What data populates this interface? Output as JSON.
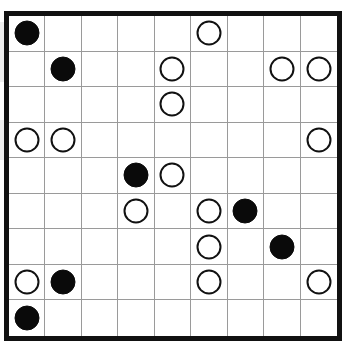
{
  "board": {
    "name": "go-style-stone-grid-puzzle",
    "columns": 9,
    "rows": 9,
    "border_color": "#111111",
    "gridline_color": "#9a9a9a",
    "background_color": "#ffffff",
    "black_stone_color": "#0a0a0a",
    "white_stone_color": "#ffffff",
    "white_stone_outline_color": "#111111",
    "empty_label": "",
    "black_label": "black-stone",
    "white_label": "white-stone",
    "cells": [
      [
        "B",
        "",
        "",
        "",
        "",
        "W",
        "",
        "",
        ""
      ],
      [
        "",
        "B",
        "",
        "",
        "W",
        "",
        "",
        "W",
        "W"
      ],
      [
        "",
        "",
        "",
        "",
        "W",
        "",
        "",
        "",
        ""
      ],
      [
        "W",
        "W",
        "",
        "",
        "",
        "",
        "",
        "",
        "W"
      ],
      [
        "",
        "",
        "",
        "B",
        "W",
        "",
        "",
        "",
        ""
      ],
      [
        "",
        "",
        "",
        "W",
        "",
        "W",
        "B",
        "",
        ""
      ],
      [
        "",
        "",
        "",
        "",
        "",
        "W",
        "",
        "B",
        ""
      ],
      [
        "W",
        "B",
        "",
        "",
        "",
        "W",
        "",
        "",
        "W"
      ],
      [
        "B",
        "",
        "",
        "",
        "",
        "",
        "",
        "",
        ""
      ]
    ],
    "counts": {
      "black": 6,
      "white": 15,
      "empty": 60
    }
  }
}
